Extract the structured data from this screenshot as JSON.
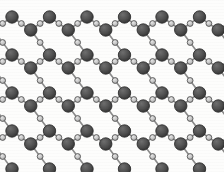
{
  "figure": {
    "kind": "molecular-lattice-diagram",
    "caption": ""
  },
  "canvas": {
    "width": 224,
    "height": 172,
    "background_color": "#fdfdfc",
    "vignette": true
  },
  "style": {
    "large_atom_fill": "#4e4e4e",
    "large_atom_stroke": "#2f2f2f",
    "large_atom_highlight": "#6e6e6e",
    "small_atom_fill": "#c2c2c2",
    "small_atom_stroke": "#555555",
    "small_atom_highlight": "#e8e8e8",
    "bond_color": "#8a8a8a",
    "bond_width": 1.6,
    "large_atom_radius": 6.2,
    "small_atom_radius": 2.9
  },
  "legend": {
    "large_atom_label": "heavy atom",
    "small_atom_label": "bridging atom"
  },
  "chart_data": {
    "type": "scatter",
    "xlabel": "",
    "ylabel": "",
    "xlim": [
      0,
      224
    ],
    "ylim": [
      0,
      172
    ],
    "grid": false,
    "legend_position": "none",
    "lattice": {
      "type": "honeycomb",
      "column_spacing": 37.5,
      "row_spacing": 38.0,
      "apex_offset": 13.0,
      "columns": 6,
      "rows": 5,
      "x_origin": 12.0,
      "y_origin": 17.0
    },
    "series": [
      {
        "name": "heavy atoms",
        "marker": "large-circle",
        "color": "#4e4e4e",
        "points": [
          [
            45,
            17
          ],
          [
            82,
            17
          ],
          [
            119,
            17
          ],
          [
            156,
            17
          ],
          [
            193,
            17
          ],
          [
            12,
            30
          ],
          [
            49,
            30
          ],
          [
            86,
            30
          ],
          [
            123,
            30
          ],
          [
            160,
            30
          ],
          [
            197,
            30
          ],
          [
            26,
            55
          ],
          [
            63,
            55
          ],
          [
            100,
            55
          ],
          [
            137,
            55
          ],
          [
            174,
            55
          ],
          [
            211,
            55
          ],
          [
            45,
            93
          ],
          [
            82,
            93
          ],
          [
            119,
            93
          ],
          [
            156,
            93
          ],
          [
            193,
            93
          ],
          [
            12,
            68
          ],
          [
            49,
            68
          ],
          [
            86,
            68
          ],
          [
            123,
            68
          ],
          [
            160,
            68
          ],
          [
            197,
            68
          ],
          [
            26,
            93
          ],
          [
            63,
            93
          ],
          [
            100,
            93
          ],
          [
            137,
            93
          ],
          [
            174,
            93
          ],
          [
            211,
            93
          ],
          [
            12,
            106
          ],
          [
            49,
            106
          ],
          [
            86,
            106
          ],
          [
            123,
            106
          ],
          [
            160,
            106
          ],
          [
            197,
            106
          ],
          [
            26,
            131
          ],
          [
            63,
            131
          ],
          [
            100,
            131
          ],
          [
            137,
            131
          ],
          [
            174,
            131
          ],
          [
            211,
            131
          ],
          [
            12,
            144
          ],
          [
            49,
            144
          ],
          [
            86,
            144
          ],
          [
            123,
            144
          ],
          [
            160,
            144
          ],
          [
            197,
            144
          ]
        ]
      },
      {
        "name": "bridging atoms",
        "marker": "small-circle",
        "color": "#c2c2c2",
        "note": "placed at midpoints of every bond"
      }
    ]
  }
}
